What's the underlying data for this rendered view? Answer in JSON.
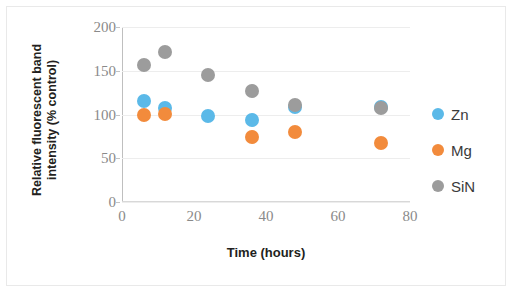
{
  "chart_data": {
    "type": "scatter",
    "title": "",
    "xlabel": "Time (hours)",
    "ylabel": "Relative fluorescent band intensity (% control)",
    "ylabel_line1": "Relative fluorescent band",
    "ylabel_line2": "intensity (% control)",
    "xlim": [
      0,
      80
    ],
    "ylim": [
      0,
      200
    ],
    "xticks": [
      "0",
      "20",
      "40",
      "60",
      "80"
    ],
    "xtick_values": [
      0,
      20,
      40,
      60,
      80
    ],
    "yticks": [
      "0",
      "50",
      "100",
      "150",
      "200"
    ],
    "ytick_values": [
      0,
      50,
      100,
      150,
      200
    ],
    "grid": true,
    "grid_axis": "y",
    "legend_position": "right",
    "x": [
      6,
      12,
      24,
      36,
      48,
      72
    ],
    "series": [
      {
        "name": "Zn",
        "color": "#5bb9e8",
        "x": [
          6,
          12,
          24,
          36,
          48,
          72
        ],
        "values": [
          115,
          108,
          98,
          94,
          109,
          109
        ]
      },
      {
        "name": "Mg",
        "color": "#f28b3c",
        "x": [
          6,
          12,
          36,
          48,
          72
        ],
        "values": [
          100,
          101,
          74,
          80,
          67
        ]
      },
      {
        "name": "SiN",
        "color": "#9c9c9c",
        "x": [
          6,
          12,
          24,
          36,
          48,
          72
        ],
        "values": [
          157,
          171,
          145,
          127,
          111,
          107
        ]
      }
    ]
  },
  "legend": {
    "items": [
      {
        "label": "Zn",
        "color": "#5bb9e8"
      },
      {
        "label": "Mg",
        "color": "#f28b3c"
      },
      {
        "label": "SiN",
        "color": "#9c9c9c"
      }
    ]
  }
}
